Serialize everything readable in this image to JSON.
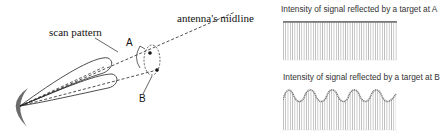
{
  "diagram": {
    "labels": {
      "scan_pattern": "scan pattern",
      "antenna_midline": "antenna's midline",
      "point_a": "A",
      "point_b": "B"
    }
  },
  "panels": [
    {
      "title": "Intensity of signal reflected by a target at A",
      "signal": "constant"
    },
    {
      "title": "Intensity of signal reflected by a target at B",
      "signal": "sinusoidal",
      "cycles": 5
    }
  ],
  "colors": {
    "line": "#222222",
    "dish": "#6b6b6b",
    "bars": "#b8b8b8",
    "curve": "#8a8a8a"
  }
}
